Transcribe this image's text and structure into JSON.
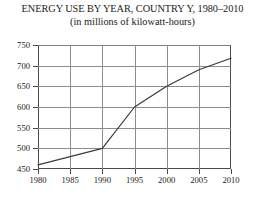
{
  "chart_data": {
    "type": "line",
    "title": "ENERGY USE BY YEAR, COUNTRY Y, 1980–2010",
    "subtitle": "(in millions of kilowatt-hours)",
    "xlabel": "",
    "ylabel": "",
    "x": [
      1980,
      1985,
      1990,
      1995,
      2000,
      2005,
      2010
    ],
    "values": [
      460,
      480,
      500,
      600,
      650,
      690,
      718
    ],
    "series": [
      {
        "name": "Energy use",
        "values": [
          460,
          480,
          500,
          600,
          650,
          690,
          718
        ]
      }
    ],
    "xlim": [
      1980,
      2010
    ],
    "ylim": [
      450,
      750
    ],
    "xticks": [
      1980,
      1985,
      1990,
      1995,
      2000,
      2005,
      2010
    ],
    "yticks": [
      450,
      500,
      550,
      600,
      650,
      700,
      750
    ],
    "xtick_labels": [
      "1980",
      "1985",
      "1990",
      "1995",
      "2000",
      "2005",
      "2010"
    ],
    "ytick_labels": [
      "450",
      "500",
      "550",
      "600",
      "650",
      "700",
      "750"
    ],
    "grid": true,
    "legend": false,
    "line_color": "#3a3a3a",
    "grid_color": "#8c8c8c",
    "axis_color": "#4a4a4a"
  }
}
